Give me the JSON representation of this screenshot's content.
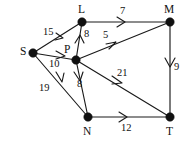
{
  "graph": {
    "nodes": [
      {
        "id": "S",
        "label": "S",
        "cx": 33,
        "cy": 53,
        "lx": 20,
        "ly": 46
      },
      {
        "id": "L",
        "label": "L",
        "cx": 82,
        "cy": 22,
        "lx": 78,
        "ly": 4
      },
      {
        "id": "P",
        "label": "P",
        "cx": 76,
        "cy": 60,
        "lx": 64,
        "ly": 44
      },
      {
        "id": "M",
        "label": "M",
        "cx": 170,
        "cy": 22,
        "lx": 164,
        "ly": 4
      },
      {
        "id": "N",
        "label": "N",
        "cx": 88,
        "cy": 117,
        "lx": 83,
        "ly": 126
      },
      {
        "id": "T",
        "label": "T",
        "cx": 170,
        "cy": 117,
        "lx": 166,
        "ly": 126
      }
    ],
    "edges": [
      {
        "id": "S-L",
        "from": "S",
        "to": "L",
        "weight": "15",
        "lx": 43,
        "ly": 27
      },
      {
        "id": "S-P",
        "from": "S",
        "to": "P",
        "weight": "10",
        "lx": 49,
        "ly": 59
      },
      {
        "id": "S-N",
        "from": "S",
        "to": "N",
        "weight": "19",
        "lx": 39,
        "ly": 83
      },
      {
        "id": "P-L",
        "from": "P",
        "to": "L",
        "weight": "8",
        "lx": 84,
        "ly": 29
      },
      {
        "id": "P-M",
        "from": "P",
        "to": "M",
        "weight": "5",
        "lx": 103,
        "ly": 30
      },
      {
        "id": "P-N",
        "from": "P",
        "to": "N",
        "weight": "8",
        "lx": 77,
        "ly": 79
      },
      {
        "id": "P-T",
        "from": "P",
        "to": "T",
        "weight": "21",
        "lx": 117,
        "ly": 68
      },
      {
        "id": "L-M",
        "from": "L",
        "to": "M",
        "weight": "7",
        "lx": 120,
        "ly": 6
      },
      {
        "id": "M-T",
        "from": "M",
        "to": "T",
        "weight": "9",
        "lx": 174,
        "ly": 62
      },
      {
        "id": "N-T",
        "from": "N",
        "to": "T",
        "weight": "12",
        "lx": 121,
        "ly": 123
      }
    ]
  }
}
